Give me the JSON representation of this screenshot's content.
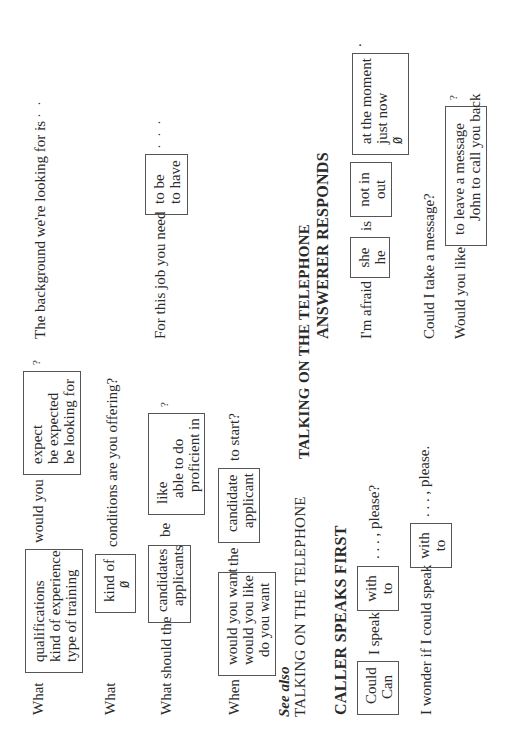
{
  "job_interview": {
    "q1": {
      "prefix": "What",
      "box1": [
        "qualifications",
        "kind of experience",
        "type of training"
      ],
      "middle": "would you",
      "box2": [
        "expect",
        "be expected",
        "be looking for"
      ],
      "suffix": "?"
    },
    "background": {
      "text": "The background we're looking for is",
      "ellipsis": ". . ."
    },
    "q2": {
      "prefix": "What",
      "box": [
        "kind of",
        "Ø"
      ],
      "suffix": "conditions are you offering?"
    },
    "job_need": {
      "text": "For this job you need",
      "box": [
        "to be",
        "to have"
      ],
      "ellipsis": ". . ."
    },
    "q3": {
      "prefix": "What should the",
      "box1": [
        "candidates",
        "applicants"
      ],
      "middle": "be",
      "box2": [
        "like",
        "able to do",
        "proficient in"
      ],
      "suffix": "?"
    },
    "q4": {
      "prefix": "When",
      "box1": [
        "would you want",
        "would you like",
        "do you want"
      ],
      "middle": "the",
      "box2": [
        "candidate",
        "applicant"
      ],
      "suffix": "to start?"
    }
  },
  "see_also": {
    "label": "See also",
    "link": "TALKING ON THE TELEPHONE"
  },
  "telephone": {
    "title": "TALKING ON THE TELEPHONE",
    "caller": {
      "heading": "CALLER SPEAKS FIRST",
      "line1": {
        "box1": [
          "Could",
          "Can"
        ],
        "middle": "I speak",
        "box2": [
          "with",
          "to"
        ],
        "suffix": ". . . , please?"
      },
      "line2": {
        "prefix": "I wonder if I could speak",
        "box": [
          "with",
          "to"
        ],
        "suffix": ". . . , please."
      }
    },
    "answerer": {
      "heading": "ANSWERER RESPONDS",
      "line1": {
        "prefix": "I'm afraid",
        "box1": [
          "she",
          "he"
        ],
        "middle": "is",
        "box2": [
          "not in",
          "out"
        ],
        "box3": [
          "at the moment",
          "just now",
          "Ø"
        ],
        "suffix": "."
      },
      "line2": {
        "text": "Could I take a message?"
      },
      "line3": {
        "prefix": "Would you like",
        "box": [
          "to leave a message",
          "John to call you back"
        ],
        "suffix": "?"
      }
    }
  }
}
